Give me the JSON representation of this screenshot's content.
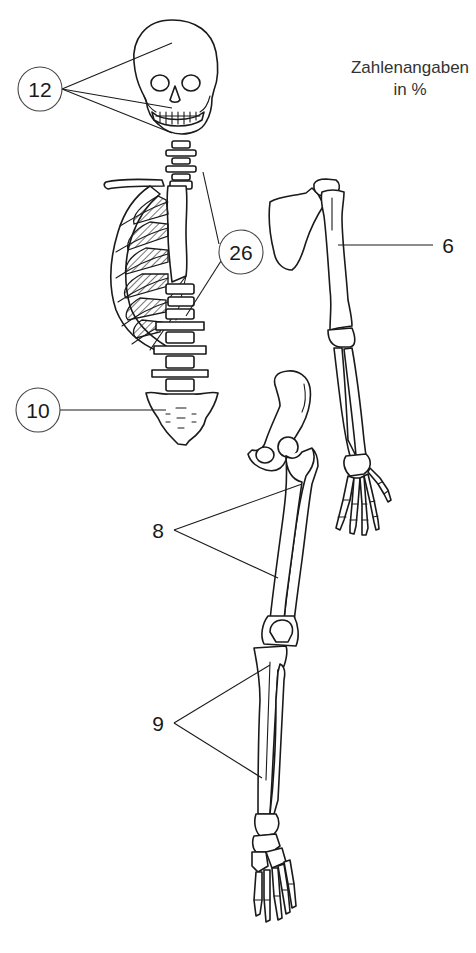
{
  "caption": {
    "line1": "Zahlenangaben",
    "line2": "in %"
  },
  "labels": {
    "skull": {
      "value": "12",
      "style": "circled"
    },
    "trunk": {
      "value": "26",
      "style": "circled"
    },
    "pelvis": {
      "value": "10",
      "style": "circled"
    },
    "arm": {
      "value": "6",
      "style": "plain"
    },
    "thigh": {
      "value": "8",
      "style": "plain"
    },
    "lower_leg": {
      "value": "9",
      "style": "plain"
    }
  },
  "colors": {
    "ink": "#1a1a1a",
    "background": "#ffffff",
    "circle_stroke": "#444444"
  }
}
